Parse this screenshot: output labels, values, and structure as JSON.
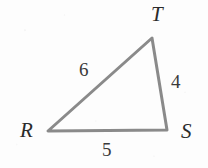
{
  "figure": {
    "kind": "geometry-diagram",
    "shape": "triangle",
    "canvas": {
      "width": 208,
      "height": 168
    },
    "background_color": "#fdfdfd",
    "stroke_color": "#8a8a8a",
    "stroke_width": 3,
    "text_color": "#2b2b2b",
    "vertices": [
      {
        "name": "R",
        "label": "R",
        "x": 48,
        "y": 131,
        "label_x": 20,
        "label_y": 120
      },
      {
        "name": "S",
        "label": "S",
        "x": 167,
        "y": 130,
        "label_x": 181,
        "label_y": 121
      },
      {
        "name": "T",
        "label": "T",
        "x": 152,
        "y": 38,
        "label_x": 151,
        "label_y": 4
      }
    ],
    "sides": [
      {
        "name": "RT",
        "label": "6",
        "value": 6,
        "from": "R",
        "to": "T",
        "label_x": 79,
        "label_y": 60
      },
      {
        "name": "TS",
        "label": "4",
        "value": 4,
        "from": "T",
        "to": "S",
        "label_x": 171,
        "label_y": 72
      },
      {
        "name": "RS",
        "label": "5",
        "value": 5,
        "from": "R",
        "to": "S",
        "label_x": 102,
        "label_y": 140
      }
    ],
    "polygon_points": "48,131 152,38 167,130"
  }
}
